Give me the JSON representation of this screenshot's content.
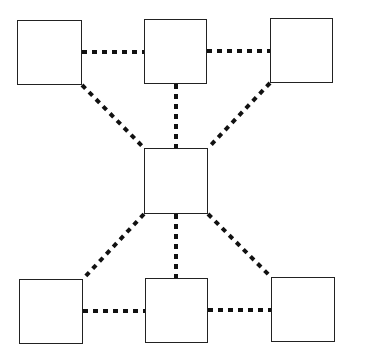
{
  "diagram": {
    "type": "network",
    "stroke_color": "#111111",
    "box_border_color": "#222222",
    "background": "#ffffff",
    "nodes": [
      {
        "id": "top-left",
        "label": "",
        "x": 17,
        "y": 20,
        "w": 65,
        "h": 65
      },
      {
        "id": "top-middle",
        "label": "",
        "x": 144,
        "y": 19,
        "w": 63,
        "h": 65
      },
      {
        "id": "top-right",
        "label": "",
        "x": 270,
        "y": 18,
        "w": 63,
        "h": 65
      },
      {
        "id": "center",
        "label": "",
        "x": 144,
        "y": 148,
        "w": 64,
        "h": 66
      },
      {
        "id": "bottom-left",
        "label": "",
        "x": 19,
        "y": 279,
        "w": 64,
        "h": 65
      },
      {
        "id": "bottom-middle",
        "label": "",
        "x": 145,
        "y": 278,
        "w": 63,
        "h": 65
      },
      {
        "id": "bottom-right",
        "label": "",
        "x": 271,
        "y": 277,
        "w": 64,
        "h": 65
      }
    ],
    "edges": [
      {
        "from": "top-left",
        "to": "top-middle",
        "style": "dotted",
        "x1": 82,
        "y1": 52,
        "x2": 144,
        "y2": 52
      },
      {
        "from": "top-middle",
        "to": "top-right",
        "style": "dotted",
        "x1": 207,
        "y1": 51,
        "x2": 270,
        "y2": 51
      },
      {
        "from": "top-left",
        "to": "center",
        "style": "dotted",
        "x1": 82,
        "y1": 85,
        "x2": 144,
        "y2": 148
      },
      {
        "from": "top-middle",
        "to": "center",
        "style": "dotted",
        "x1": 176,
        "y1": 84,
        "x2": 176,
        "y2": 148
      },
      {
        "from": "top-right",
        "to": "center",
        "style": "dotted",
        "x1": 270,
        "y1": 83,
        "x2": 208,
        "y2": 148
      },
      {
        "from": "center",
        "to": "bottom-left",
        "style": "dotted",
        "x1": 144,
        "y1": 214,
        "x2": 83,
        "y2": 279
      },
      {
        "from": "center",
        "to": "bottom-middle",
        "style": "dotted",
        "x1": 176,
        "y1": 214,
        "x2": 176,
        "y2": 278
      },
      {
        "from": "center",
        "to": "bottom-right",
        "style": "dotted",
        "x1": 208,
        "y1": 214,
        "x2": 271,
        "y2": 277
      },
      {
        "from": "bottom-left",
        "to": "bottom-middle",
        "style": "dotted",
        "x1": 83,
        "y1": 311,
        "x2": 145,
        "y2": 311
      },
      {
        "from": "bottom-middle",
        "to": "bottom-right",
        "style": "dotted",
        "x1": 208,
        "y1": 310,
        "x2": 271,
        "y2": 310
      }
    ]
  }
}
